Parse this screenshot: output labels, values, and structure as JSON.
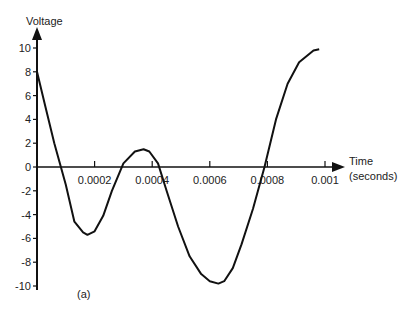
{
  "chart_data": {
    "type": "line",
    "title": "",
    "xlabel": "Time (seconds)",
    "xlabel_lines": [
      "Time",
      "(seconds)"
    ],
    "ylabel": "Voltage",
    "xlim": [
      0,
      0.001
    ],
    "ylim": [
      -10,
      10
    ],
    "x_ticks": [
      0.0002,
      0.0004,
      0.0006,
      0.0008,
      0.001
    ],
    "x_tick_labels": [
      "0.0002",
      "0.0004",
      "0.0006",
      "0.0008",
      "0.001"
    ],
    "y_ticks": [
      10,
      8,
      6,
      4,
      2,
      0,
      -2,
      -4,
      -6,
      -8,
      -10
    ],
    "y_tick_labels": [
      "10",
      "8",
      "6",
      "4",
      "2",
      "0",
      "-2",
      "-4",
      "-6",
      "-8",
      "-10"
    ],
    "grid": false,
    "annotation": "(a)",
    "series": [
      {
        "name": "Voltage",
        "x": [
          0,
          3e-05,
          6e-05,
          0.0001,
          0.00013,
          0.00016,
          0.000175,
          0.0002,
          0.00023,
          0.00026,
          0.0003,
          0.00034,
          0.00037,
          0.00039,
          0.00042,
          0.00045,
          0.00049,
          0.00053,
          0.00057,
          0.0006,
          0.00063,
          0.00065,
          0.00068,
          0.00071,
          0.00075,
          0.00079,
          0.00083,
          0.00087,
          0.00091,
          0.00096,
          0.00098
        ],
        "values": [
          8,
          5.0,
          2.0,
          -1.5,
          -4.6,
          -5.5,
          -5.7,
          -5.4,
          -4.1,
          -2.0,
          0.3,
          1.3,
          1.5,
          1.3,
          0.3,
          -2.0,
          -5.0,
          -7.5,
          -9.0,
          -9.6,
          -9.8,
          -9.6,
          -8.5,
          -6.5,
          -3.5,
          0.0,
          4.0,
          7.0,
          8.8,
          9.8,
          9.9
        ]
      }
    ]
  }
}
